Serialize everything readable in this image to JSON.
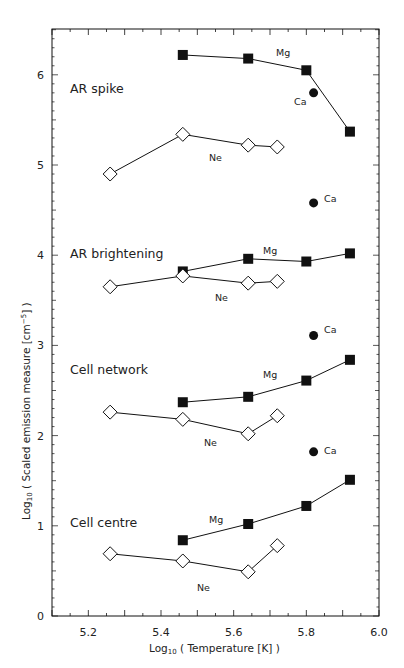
{
  "chart_data": {
    "type": "line",
    "title": "",
    "xlabel": "Log10 ( Temperature [K] )",
    "ylabel": "Log10 ( Scaled emission measure [cm^-5] )",
    "xlim": [
      5.1,
      6.0
    ],
    "ylim": [
      0,
      6.5
    ],
    "x_ticks": [
      "5.2",
      "5.4",
      "5.6",
      "5.8",
      "6.0"
    ],
    "y_ticks": [
      "0",
      "1",
      "2",
      "3",
      "4",
      "5",
      "6"
    ],
    "grid": false,
    "legend": "none (inline series labels)",
    "panels": [
      {
        "name": "AR spike",
        "series": [
          {
            "name": "Mg",
            "marker": "filled-square",
            "x": [
              5.46,
              5.64,
              5.8,
              5.92
            ],
            "values": [
              6.22,
              6.18,
              6.05,
              5.37
            ]
          },
          {
            "name": "Ne",
            "marker": "open-diamond",
            "x": [
              5.26,
              5.46,
              5.64,
              5.72
            ],
            "values": [
              4.9,
              5.34,
              5.22,
              5.2
            ]
          },
          {
            "name": "Ca",
            "marker": "filled-circle",
            "x": [
              5.82
            ],
            "values": [
              5.8
            ]
          }
        ]
      },
      {
        "name": "AR brightening",
        "series": [
          {
            "name": "Mg",
            "marker": "filled-square",
            "x": [
              5.46,
              5.64,
              5.8,
              5.92
            ],
            "values": [
              3.82,
              3.96,
              3.93,
              4.02
            ]
          },
          {
            "name": "Ne",
            "marker": "open-diamond",
            "x": [
              5.26,
              5.46,
              5.64,
              5.72
            ],
            "values": [
              3.65,
              3.77,
              3.69,
              3.71
            ]
          },
          {
            "name": "Ca",
            "marker": "filled-circle",
            "x": [
              5.82
            ],
            "values": [
              4.58
            ]
          }
        ]
      },
      {
        "name": "Cell network",
        "series": [
          {
            "name": "Mg",
            "marker": "filled-square",
            "x": [
              5.46,
              5.64,
              5.8,
              5.92
            ],
            "values": [
              2.37,
              2.43,
              2.61,
              2.84
            ]
          },
          {
            "name": "Ne",
            "marker": "open-diamond",
            "x": [
              5.26,
              5.46,
              5.64,
              5.72
            ],
            "values": [
              2.26,
              2.18,
              2.02,
              2.22
            ]
          },
          {
            "name": "Ca",
            "marker": "filled-circle",
            "x": [
              5.82
            ],
            "values": [
              3.11
            ]
          }
        ]
      },
      {
        "name": "Cell centre",
        "series": [
          {
            "name": "Mg",
            "marker": "filled-square",
            "x": [
              5.46,
              5.64,
              5.8,
              5.92
            ],
            "values": [
              0.84,
              1.02,
              1.22,
              1.51
            ]
          },
          {
            "name": "Ne",
            "marker": "open-diamond",
            "x": [
              5.26,
              5.46,
              5.64,
              5.72
            ],
            "values": [
              0.69,
              0.61,
              0.49,
              0.78
            ]
          },
          {
            "name": "Ca",
            "marker": "filled-circle",
            "x": [
              5.82
            ],
            "values": [
              1.82
            ]
          }
        ]
      }
    ]
  },
  "labels": {
    "panel_ar_spike": "AR spike",
    "panel_ar_brightening": "AR brightening",
    "panel_cell_network": "Cell network",
    "panel_cell_centre": "Cell centre",
    "mg": "Mg",
    "ne": "Ne",
    "ca": "Ca",
    "xlabel_prefix": "Log",
    "xlabel_sub": "10",
    "xlabel_rest": " ( Temperature [K] )",
    "ylabel_prefix": "Log",
    "ylabel_sub": "10",
    "ylabel_mid": " ( Scaled emission measure [cm",
    "ylabel_sup": "−5",
    "ylabel_end": "] )"
  },
  "colors": {
    "ink": "#111111",
    "background": "#ffffff"
  }
}
